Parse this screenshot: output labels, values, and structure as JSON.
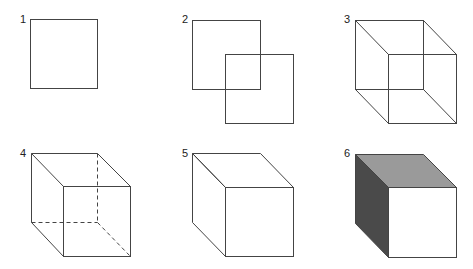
{
  "figures": [
    {
      "label": "1",
      "description": "single square"
    },
    {
      "label": "2",
      "description": "two overlapping offset squares"
    },
    {
      "label": "3",
      "description": "wireframe cube with corners connected"
    },
    {
      "label": "4",
      "description": "cube with hidden edges dashed"
    },
    {
      "label": "5",
      "description": "solid cube with hidden edges removed"
    },
    {
      "label": "6",
      "description": "shaded cube"
    }
  ],
  "colors": {
    "line": "#444444",
    "top_face": "#9a9a9a",
    "side_face": "#4a4a4a",
    "front_face": "#ffffff"
  }
}
